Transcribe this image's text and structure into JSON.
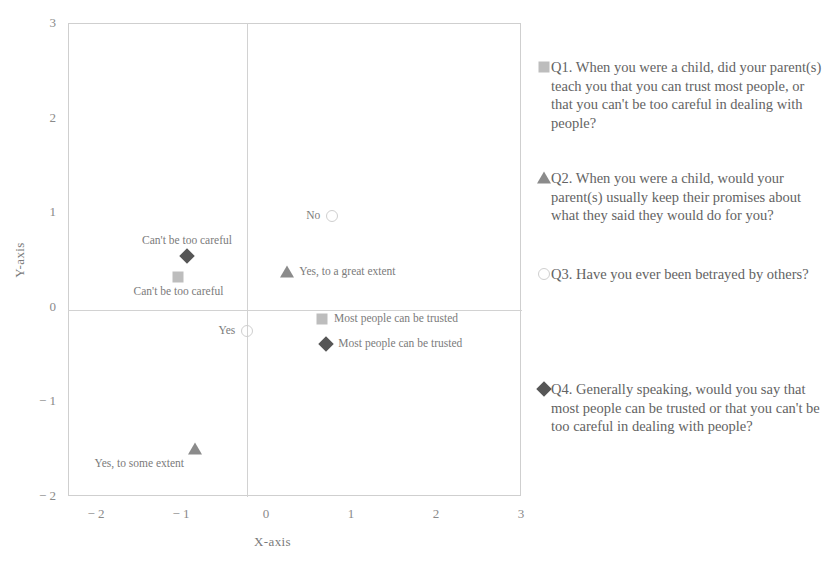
{
  "chart_data": {
    "type": "scatter",
    "title": "",
    "xlabel": "X-axis",
    "ylabel": "Y-axis",
    "xlim": [
      -2.33,
      3
    ],
    "ylim": [
      -2,
      3
    ],
    "xticks": [
      "− 2",
      "− 1",
      "0",
      "1",
      "2",
      "3"
    ],
    "xtick_values": [
      -2,
      -1,
      0,
      1,
      2,
      3
    ],
    "yticks": [
      "3",
      "2",
      "1",
      "0",
      "− 1",
      "− 2"
    ],
    "ytick_values": [
      3,
      2,
      1,
      0,
      -1,
      -2
    ],
    "grid": false,
    "legend_position": "right",
    "points": [
      {
        "series": "Q4",
        "marker": "diamond",
        "x": -0.93,
        "y": 0.54,
        "label": "Can't be too careful",
        "label_pos": "above"
      },
      {
        "series": "Q1",
        "marker": "square",
        "x": -1.03,
        "y": 0.31,
        "label": "Can't be too careful",
        "label_pos": "below"
      },
      {
        "series": "Q3",
        "marker": "circle",
        "x": 0.78,
        "y": 0.96,
        "label": "No",
        "label_pos": "left"
      },
      {
        "series": "Q2",
        "marker": "triangle",
        "x": 0.25,
        "y": 0.37,
        "label": "Yes, to a great extent",
        "label_pos": "right"
      },
      {
        "series": "Q1",
        "marker": "square",
        "x": 0.66,
        "y": -0.13,
        "label": "Most people can be trusted",
        "label_pos": "right"
      },
      {
        "series": "Q4",
        "marker": "diamond",
        "x": 0.71,
        "y": -0.39,
        "label": "Most people can be trusted",
        "label_pos": "right"
      },
      {
        "series": "Q3",
        "marker": "circle",
        "x": -0.22,
        "y": -0.26,
        "label": "Yes",
        "label_pos": "left"
      },
      {
        "series": "Q2",
        "marker": "triangle",
        "x": -0.83,
        "y": -1.5,
        "label": "Yes, to some extent",
        "label_pos": "below-left"
      }
    ],
    "series": [
      {
        "name": "Q1",
        "marker": "square",
        "color": "#bdbdbd"
      },
      {
        "name": "Q2",
        "marker": "triangle",
        "color": "#8b8b8b"
      },
      {
        "name": "Q3",
        "marker": "circle",
        "color": "#cfcfcf"
      },
      {
        "name": "Q4",
        "marker": "diamond",
        "color": "#565656"
      }
    ]
  },
  "legend": {
    "q1": "Q1. When you were a child, did your parent(s) teach you that you can trust most people, or that you can't be too careful in dealing with people?",
    "q2": "Q2. When you were a child, would your parent(s) usually keep their promises about what they said they would do for you?",
    "q3": "Q3. Have you ever been betrayed by others?",
    "q4": "Q4. Generally speaking, would you say that most people can be trusted or that you can't be too careful in dealing with people?"
  },
  "axes": {
    "x_title": "X-axis",
    "y_title": "Y-axis"
  },
  "labels": {
    "cant_be_too_careful": "Can't be too careful",
    "no": "No",
    "yes": "Yes",
    "yes_great_extent": "Yes, to a great extent",
    "yes_some_extent": "Yes, to some extent",
    "most_people_trusted": "Most people can be trusted"
  }
}
